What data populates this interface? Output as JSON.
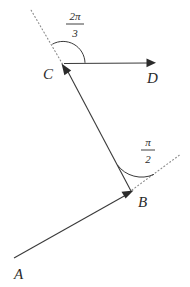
{
  "figure": {
    "background_color": "#ffffff",
    "line_color": "#3a3a3a",
    "dotted_color": "#8a8a8a",
    "label_color": "#2b2b2b",
    "width": 190,
    "height": 287
  },
  "points": {
    "a": {
      "label": "A",
      "x": 14,
      "y": 258,
      "label_x": 14,
      "label_y": 279
    },
    "b": {
      "label": "B",
      "x": 131,
      "y": 192,
      "label_x": 138,
      "label_y": 207
    },
    "c": {
      "label": "C",
      "x": 63,
      "y": 65,
      "label_x": 43,
      "label_y": 79
    },
    "d": {
      "label": "D",
      "x": 155,
      "y": 63,
      "label_x": 147,
      "label_y": 83
    }
  },
  "vectors": [
    {
      "name": "vector-a-to-b",
      "from": "A",
      "to": "B",
      "style": "solid",
      "arrow_at": "B"
    },
    {
      "name": "vector-b-to-c",
      "from": "B",
      "to": "C",
      "style": "solid",
      "arrow_at": "C"
    },
    {
      "name": "vector-c-to-d",
      "from": "C",
      "to": "D",
      "style": "solid",
      "arrow_at": "D"
    }
  ],
  "extension_rays": [
    {
      "name": "dotted-ray-at-b",
      "from": "B",
      "style": "dotted",
      "to_x": 181,
      "to_y": 154
    },
    {
      "name": "dotted-ray-at-c",
      "from": "C",
      "style": "dotted",
      "to_x": 31,
      "to_y": 10
    }
  ],
  "angles": [
    {
      "name": "angle-at-b",
      "vertex": "B",
      "numerator": "π",
      "denominator": "2",
      "value_radians": 1.5708,
      "label_x": 148,
      "num_y": 146,
      "bar_y": 150,
      "den_y": 163
    },
    {
      "name": "angle-at-c",
      "vertex": "C",
      "numerator": "2π",
      "denominator": "3",
      "value_radians": 2.0944,
      "label_x": 75,
      "num_y": 20,
      "bar_y": 24,
      "den_y": 37
    }
  ]
}
